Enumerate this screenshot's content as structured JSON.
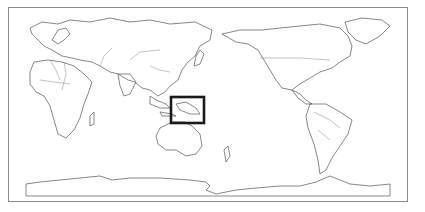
{
  "map": {
    "projection": "equirectangular, Pacific-centered (~150°E central meridian)",
    "style": "grayscale outline world map with country borders",
    "highlight_box": {
      "label": "New Guinea / Papua region",
      "x": 171,
      "y": 97,
      "width": 33,
      "height": 26,
      "stroke_color": "#1a1a1a"
    },
    "frame_color": "#8a8a8a",
    "land_stroke_color": "#555555",
    "regions_visible": [
      "Europe",
      "Africa",
      "Asia",
      "Australia",
      "North America",
      "South America",
      "Greenland",
      "Antarctica",
      "Oceania islands"
    ]
  }
}
